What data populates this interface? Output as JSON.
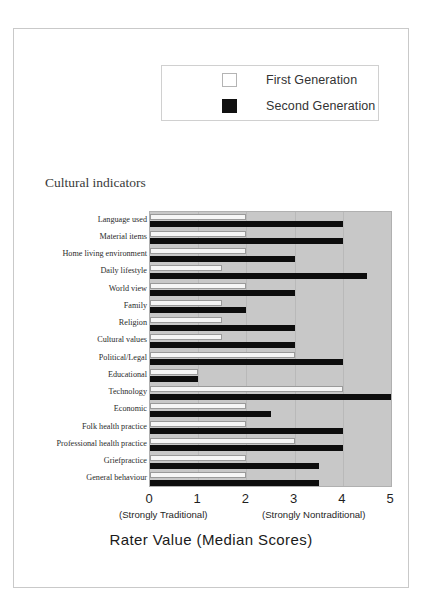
{
  "figure": {
    "y_axis_header": "Cultural indicators",
    "x_title": "Rater Value (Median Scores)",
    "caption_left": "(Strongly Traditional)",
    "caption_right": "(Strongly Nontraditional)"
  },
  "legend": {
    "items": [
      {
        "label": "First Generation",
        "swatch": "white-square-swatch"
      },
      {
        "label": "Second Generation",
        "swatch": "black-square-swatch"
      }
    ]
  },
  "chart_data": {
    "type": "bar",
    "orientation": "horizontal",
    "title": "Rater Value (Median Scores)",
    "xlabel": "Rater Value (Median Scores)",
    "ylabel": "Cultural indicators",
    "xlim": [
      0,
      5
    ],
    "xticks": [
      "0",
      "1",
      "2",
      "3",
      "4",
      "5"
    ],
    "grid": true,
    "legend_position": "top",
    "categories": [
      "Language used",
      "Material items",
      "Home living environment",
      "Daily lifestyle",
      "World view",
      "Family",
      "Religion",
      "Cultural values",
      "Political/Legal",
      "Educational",
      "Technology",
      "Economic",
      "Folk health practice",
      "Professional health practice",
      "Griefpractice",
      "General behaviour"
    ],
    "series": [
      {
        "name": "First Generation",
        "color": "#f6f6f6",
        "values": [
          2,
          2,
          2,
          1.5,
          2,
          1.5,
          1.5,
          1.5,
          3,
          1,
          4,
          2,
          2,
          3,
          2,
          2
        ]
      },
      {
        "name": "Second Generation",
        "color": "#0d0d0d",
        "values": [
          4,
          4,
          3,
          4.5,
          3,
          2,
          3,
          3,
          4,
          1,
          5,
          2.5,
          4,
          4,
          3.5,
          3.5
        ]
      }
    ]
  }
}
